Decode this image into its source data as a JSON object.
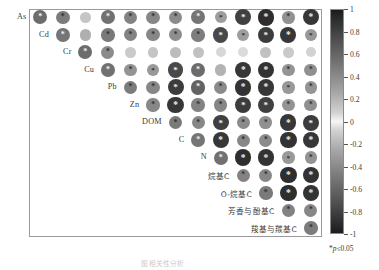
{
  "figure": {
    "caption": "图 相关性分析",
    "significance_note_prefix": "*",
    "significance_note": "p≤0.05"
  },
  "colorbar": {
    "name": "correlation-colorbar",
    "vmin": -1,
    "vmax": 1,
    "ticks": [
      1,
      0.8,
      0.6,
      0.4,
      0.2,
      0,
      -0.2,
      -0.4,
      -0.6,
      -0.8,
      -1
    ],
    "tick_labels": [
      "1",
      "0.8",
      "0.6",
      "0.4",
      "0.2",
      "0",
      "-0.2",
      "-0.4",
      "-0.6",
      "-0.8",
      "-1"
    ],
    "colormap": "grayscale-diverging",
    "low_color": "#1c1c1c",
    "mid_color": "#f6f6f6",
    "high_color": "#1c1c1c"
  },
  "chart_data": {
    "type": "heatmap",
    "subtype": "upper-triangular-correlation-matrix",
    "title": "",
    "xlabel": "",
    "ylabel": "",
    "grid": true,
    "legend_position": "right",
    "zlim": [
      -1,
      1
    ],
    "marker": "circle-sized-and-shaded-by-correlation",
    "significance_marker": "*",
    "significance_threshold": 0.05,
    "variables": [
      "As",
      "Cd",
      "Cr",
      "Cu",
      "Pb",
      "Zn",
      "DOM",
      "C",
      "N",
      "烷基C",
      "O-烷基C",
      "芳香与酚基C",
      "羧基与羰基C",
      ""
    ],
    "categories": [
      "As",
      "Cd",
      "Cr",
      "Cu",
      "Pb",
      "Zn",
      "DOM",
      "C",
      "N",
      "烷基C",
      "O-烷基C",
      "芳香与酚基C",
      "羧基与羰基C",
      ""
    ],
    "cells": [
      {
        "row": 0,
        "col": 1,
        "r": 0.62,
        "sig": true
      },
      {
        "row": 0,
        "col": 2,
        "r": 0.55,
        "sig": true
      },
      {
        "row": 0,
        "col": 3,
        "r": 0.22,
        "sig": false
      },
      {
        "row": 0,
        "col": 4,
        "r": 0.6,
        "sig": true
      },
      {
        "row": 0,
        "col": 5,
        "r": 0.52,
        "sig": true
      },
      {
        "row": 0,
        "col": 6,
        "r": 0.5,
        "sig": true
      },
      {
        "row": 0,
        "col": 7,
        "r": 0.48,
        "sig": true
      },
      {
        "row": 0,
        "col": 8,
        "r": 0.58,
        "sig": true
      },
      {
        "row": 0,
        "col": 9,
        "r": 0.4,
        "sig": true
      },
      {
        "row": 0,
        "col": 10,
        "r": 0.82,
        "sig": true
      },
      {
        "row": 0,
        "col": 11,
        "r": 0.9,
        "sig": true
      },
      {
        "row": 0,
        "col": 12,
        "r": 0.45,
        "sig": true
      },
      {
        "row": 0,
        "col": 13,
        "r": 0.86,
        "sig": true
      },
      {
        "row": 1,
        "col": 2,
        "r": 0.58,
        "sig": true
      },
      {
        "row": 1,
        "col": 3,
        "r": 0.32,
        "sig": false
      },
      {
        "row": 1,
        "col": 4,
        "r": 0.56,
        "sig": true
      },
      {
        "row": 1,
        "col": 5,
        "r": 0.52,
        "sig": true
      },
      {
        "row": 1,
        "col": 6,
        "r": 0.5,
        "sig": true
      },
      {
        "row": 1,
        "col": 7,
        "r": 0.47,
        "sig": true
      },
      {
        "row": 1,
        "col": 8,
        "r": 0.54,
        "sig": true
      },
      {
        "row": 1,
        "col": 9,
        "r": 0.78,
        "sig": true
      },
      {
        "row": 1,
        "col": 10,
        "r": 0.4,
        "sig": true
      },
      {
        "row": 1,
        "col": 11,
        "r": 0.84,
        "sig": true
      },
      {
        "row": 1,
        "col": 12,
        "r": 0.86,
        "sig": true
      },
      {
        "row": 1,
        "col": 13,
        "r": 0.42,
        "sig": true
      },
      {
        "row": 2,
        "col": 3,
        "r": 0.62,
        "sig": true
      },
      {
        "row": 2,
        "col": 4,
        "r": 0.48,
        "sig": true
      },
      {
        "row": 2,
        "col": 5,
        "r": 0.2,
        "sig": false
      },
      {
        "row": 2,
        "col": 6,
        "r": 0.22,
        "sig": false
      },
      {
        "row": 2,
        "col": 7,
        "r": 0.26,
        "sig": false
      },
      {
        "row": 2,
        "col": 8,
        "r": 0.24,
        "sig": false
      },
      {
        "row": 2,
        "col": 9,
        "r": 0.14,
        "sig": false
      },
      {
        "row": 2,
        "col": 10,
        "r": 0.12,
        "sig": false
      },
      {
        "row": 2,
        "col": 11,
        "r": 0.24,
        "sig": false
      },
      {
        "row": 2,
        "col": 12,
        "r": 0.2,
        "sig": false
      },
      {
        "row": 2,
        "col": 13,
        "r": 0.16,
        "sig": false
      },
      {
        "row": 3,
        "col": 4,
        "r": 0.6,
        "sig": true
      },
      {
        "row": 3,
        "col": 5,
        "r": 0.44,
        "sig": true
      },
      {
        "row": 3,
        "col": 6,
        "r": 0.42,
        "sig": true
      },
      {
        "row": 3,
        "col": 7,
        "r": 0.78,
        "sig": true
      },
      {
        "row": 3,
        "col": 8,
        "r": 0.62,
        "sig": true
      },
      {
        "row": 3,
        "col": 9,
        "r": 0.3,
        "sig": false
      },
      {
        "row": 3,
        "col": 10,
        "r": 0.86,
        "sig": true
      },
      {
        "row": 3,
        "col": 11,
        "r": 0.88,
        "sig": true
      },
      {
        "row": 3,
        "col": 12,
        "r": 0.44,
        "sig": true
      },
      {
        "row": 3,
        "col": 13,
        "r": 0.46,
        "sig": true
      },
      {
        "row": 4,
        "col": 5,
        "r": 0.55,
        "sig": true
      },
      {
        "row": 4,
        "col": 6,
        "r": 0.5,
        "sig": true
      },
      {
        "row": 4,
        "col": 7,
        "r": 0.84,
        "sig": true
      },
      {
        "row": 4,
        "col": 8,
        "r": 0.66,
        "sig": true
      },
      {
        "row": 4,
        "col": 9,
        "r": 0.48,
        "sig": true
      },
      {
        "row": 4,
        "col": 10,
        "r": 0.88,
        "sig": true
      },
      {
        "row": 4,
        "col": 11,
        "r": 0.86,
        "sig": true
      },
      {
        "row": 4,
        "col": 12,
        "r": 0.42,
        "sig": true
      },
      {
        "row": 4,
        "col": 13,
        "r": 0.44,
        "sig": true
      },
      {
        "row": 5,
        "col": 6,
        "r": 0.5,
        "sig": true
      },
      {
        "row": 5,
        "col": 7,
        "r": 0.86,
        "sig": true
      },
      {
        "row": 5,
        "col": 8,
        "r": 0.52,
        "sig": true
      },
      {
        "row": 5,
        "col": 9,
        "r": 0.5,
        "sig": true
      },
      {
        "row": 5,
        "col": 10,
        "r": 0.84,
        "sig": true
      },
      {
        "row": 5,
        "col": 11,
        "r": 0.82,
        "sig": true
      },
      {
        "row": 5,
        "col": 12,
        "r": 0.44,
        "sig": true
      },
      {
        "row": 5,
        "col": 13,
        "r": 0.46,
        "sig": true
      },
      {
        "row": 6,
        "col": 7,
        "r": 0.56,
        "sig": true
      },
      {
        "row": 6,
        "col": 8,
        "r": 0.5,
        "sig": true
      },
      {
        "row": 6,
        "col": 9,
        "r": 0.82,
        "sig": true
      },
      {
        "row": 6,
        "col": 10,
        "r": 0.48,
        "sig": true
      },
      {
        "row": 6,
        "col": 11,
        "r": 0.46,
        "sig": true
      },
      {
        "row": 6,
        "col": 12,
        "r": 0.86,
        "sig": true
      },
      {
        "row": 6,
        "col": 13,
        "r": 0.84,
        "sig": true
      },
      {
        "row": 7,
        "col": 8,
        "r": 0.58,
        "sig": true
      },
      {
        "row": 7,
        "col": 9,
        "r": 0.86,
        "sig": true
      },
      {
        "row": 7,
        "col": 10,
        "r": 0.5,
        "sig": true
      },
      {
        "row": 7,
        "col": 11,
        "r": 0.48,
        "sig": true
      },
      {
        "row": 7,
        "col": 12,
        "r": 0.88,
        "sig": true
      },
      {
        "row": 7,
        "col": 13,
        "r": 0.86,
        "sig": true
      },
      {
        "row": 8,
        "col": 9,
        "r": 0.6,
        "sig": true
      },
      {
        "row": 8,
        "col": 10,
        "r": 0.9,
        "sig": true
      },
      {
        "row": 8,
        "col": 11,
        "r": 0.88,
        "sig": true
      },
      {
        "row": 8,
        "col": 12,
        "r": 0.42,
        "sig": true
      },
      {
        "row": 8,
        "col": 13,
        "r": 0.44,
        "sig": true
      },
      {
        "row": 9,
        "col": 10,
        "r": 0.52,
        "sig": true
      },
      {
        "row": 9,
        "col": 11,
        "r": 0.5,
        "sig": true
      },
      {
        "row": 9,
        "col": 12,
        "r": 0.9,
        "sig": true
      },
      {
        "row": 9,
        "col": 13,
        "r": 0.88,
        "sig": true
      },
      {
        "row": 10,
        "col": 11,
        "r": 0.56,
        "sig": true
      },
      {
        "row": 10,
        "col": 12,
        "r": 0.9,
        "sig": true
      },
      {
        "row": 10,
        "col": 13,
        "r": 0.88,
        "sig": true
      },
      {
        "row": 11,
        "col": 12,
        "r": 0.52,
        "sig": true
      },
      {
        "row": 11,
        "col": 13,
        "r": 0.5,
        "sig": true
      },
      {
        "row": 12,
        "col": 13,
        "r": 0.55,
        "sig": true
      }
    ]
  }
}
